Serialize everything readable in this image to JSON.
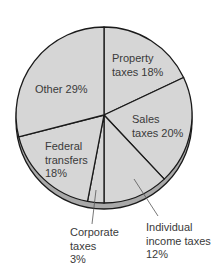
{
  "chart_data": {
    "type": "pie",
    "title": "",
    "start_angle_deg": 0,
    "direction": "clockwise",
    "style": "3d-rim",
    "colors": {
      "face": "#d6d6d6",
      "rim": "#a9a9a9",
      "stroke": "#1a1a1a",
      "text": "#3a3a3a"
    },
    "slices": [
      {
        "name": "Property taxes",
        "value": 18,
        "label_lines": [
          "Property",
          "taxes 18%"
        ]
      },
      {
        "name": "Sales taxes",
        "value": 20,
        "label_lines": [
          "Sales",
          "taxes 20%"
        ]
      },
      {
        "name": "Individual income taxes",
        "value": 12,
        "label_lines": [
          "Individual",
          "income taxes",
          "12%"
        ],
        "callout": true
      },
      {
        "name": "Corporate taxes",
        "value": 3,
        "label_lines": [
          "Corporate",
          "taxes",
          "3%"
        ],
        "callout": true
      },
      {
        "name": "Federal transfers",
        "value": 18,
        "label_lines": [
          "Federal",
          "transfers",
          "18%"
        ]
      },
      {
        "name": "Other",
        "value": 29,
        "label_lines": [
          "Other 29%"
        ]
      }
    ]
  }
}
